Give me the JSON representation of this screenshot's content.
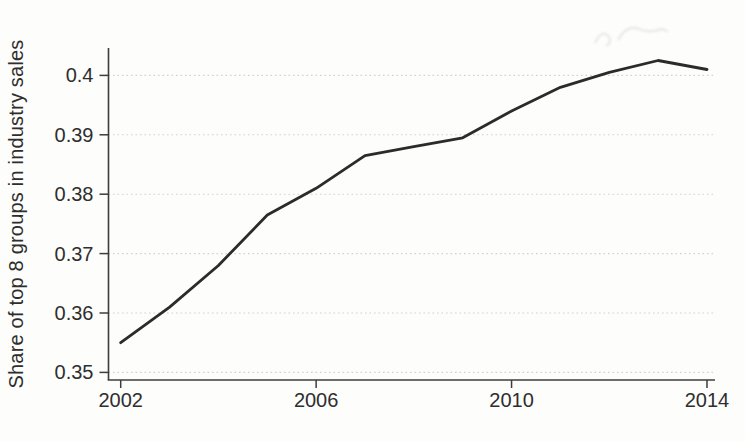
{
  "chart_data": {
    "type": "line",
    "title": "",
    "xlabel": "",
    "ylabel": "Share of top 8 groups in industry sales",
    "x": [
      2002,
      2003,
      2004,
      2005,
      2006,
      2007,
      2008,
      2009,
      2010,
      2011,
      2012,
      2013,
      2014
    ],
    "values": [
      0.355,
      0.361,
      0.368,
      0.3765,
      0.381,
      0.3865,
      0.388,
      0.3895,
      0.394,
      0.398,
      0.4005,
      0.4025,
      0.401
    ],
    "series_name": "Share of top 8 groups in industry sales",
    "xlim": [
      2002,
      2014
    ],
    "ylim": [
      0.35,
      0.405
    ],
    "yticks": [
      {
        "v": 0.35,
        "label": "0.35"
      },
      {
        "v": 0.36,
        "label": "0.36"
      },
      {
        "v": 0.37,
        "label": "0.37"
      },
      {
        "v": 0.38,
        "label": "0.38"
      },
      {
        "v": 0.39,
        "label": "0.39"
      },
      {
        "v": 0.4,
        "label": "0.4"
      }
    ],
    "xticks": [
      {
        "v": 2002,
        "label": "2002"
      },
      {
        "v": 2006,
        "label": "2006"
      },
      {
        "v": 2010,
        "label": "2010"
      },
      {
        "v": 2014,
        "label": "2014"
      }
    ],
    "grid": "horizontal-dotted",
    "legend": "none",
    "colors": {
      "line": "#2b2b2b",
      "axis": "#3d3d3d",
      "grid": "#d4d1cc",
      "text": "#2e2e2e",
      "background": "#fdfdfc"
    }
  }
}
